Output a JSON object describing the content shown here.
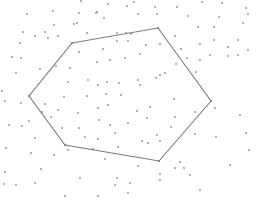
{
  "diagram": {
    "type": "polygon-over-point-cloud",
    "width": 263,
    "height": 215,
    "background": "#ffffff",
    "line_color": "#7a7a7a",
    "point_color": "#8a8a8a",
    "polygon": [
      [
        72,
        43
      ],
      [
        158,
        28
      ],
      [
        211,
        101
      ],
      [
        159,
        161
      ],
      [
        65,
        145
      ],
      [
        29,
        96
      ]
    ],
    "points": [
      [
        81,
        1
      ],
      [
        108,
        4
      ],
      [
        134,
        2
      ],
      [
        27,
        14
      ],
      [
        53,
        11
      ],
      [
        79,
        13
      ],
      [
        97,
        12
      ],
      [
        127,
        6
      ],
      [
        155,
        7
      ],
      [
        177,
        7
      ],
      [
        202,
        2
      ],
      [
        222,
        3
      ],
      [
        246,
        8
      ],
      [
        54,
        25
      ],
      [
        104,
        18
      ],
      [
        77,
        23
      ],
      [
        96,
        13
      ],
      [
        138,
        14
      ],
      [
        188,
        16
      ],
      [
        157,
        14
      ],
      [
        219,
        17
      ],
      [
        248,
        14
      ],
      [
        23,
        32
      ],
      [
        45,
        32
      ],
      [
        35,
        36
      ],
      [
        58,
        36
      ],
      [
        48,
        38
      ],
      [
        74,
        24
      ],
      [
        87,
        33
      ],
      [
        117,
        33
      ],
      [
        126,
        33
      ],
      [
        198,
        27
      ],
      [
        214,
        27
      ],
      [
        243,
        23
      ],
      [
        20,
        43
      ],
      [
        21,
        58
      ],
      [
        12,
        57
      ],
      [
        131,
        34
      ],
      [
        175,
        36
      ],
      [
        214,
        40
      ],
      [
        238,
        40
      ],
      [
        79,
        52
      ],
      [
        103,
        49
      ],
      [
        117,
        41
      ],
      [
        128,
        41
      ],
      [
        146,
        45
      ],
      [
        160,
        44
      ],
      [
        181,
        49
      ],
      [
        200,
        44
      ],
      [
        228,
        47
      ],
      [
        248,
        50
      ],
      [
        70,
        68
      ],
      [
        97,
        62
      ],
      [
        110,
        60
      ],
      [
        125,
        58
      ],
      [
        140,
        54
      ],
      [
        200,
        60
      ],
      [
        228,
        56
      ],
      [
        238,
        55
      ],
      [
        16,
        73
      ],
      [
        40,
        69
      ],
      [
        56,
        66
      ],
      [
        68,
        82
      ],
      [
        88,
        80
      ],
      [
        107,
        82
      ],
      [
        119,
        83
      ],
      [
        138,
        80
      ],
      [
        156,
        78
      ],
      [
        176,
        64
      ],
      [
        187,
        58
      ],
      [
        210,
        55
      ],
      [
        196,
        72
      ],
      [
        2,
        91
      ],
      [
        5,
        101
      ],
      [
        21,
        103
      ],
      [
        45,
        104
      ],
      [
        64,
        97
      ],
      [
        87,
        96
      ],
      [
        98,
        85
      ],
      [
        106,
        94
      ],
      [
        121,
        95
      ],
      [
        140,
        85
      ],
      [
        160,
        75
      ],
      [
        165,
        73
      ],
      [
        42,
        112
      ],
      [
        51,
        117
      ],
      [
        78,
        113
      ],
      [
        98,
        108
      ],
      [
        108,
        105
      ],
      [
        137,
        111
      ],
      [
        150,
        107
      ],
      [
        174,
        99
      ],
      [
        195,
        112
      ],
      [
        215,
        108
      ],
      [
        246,
        133
      ],
      [
        240,
        115
      ],
      [
        9,
        125
      ],
      [
        6,
        148
      ],
      [
        29,
        121
      ],
      [
        58,
        110
      ],
      [
        62,
        128
      ],
      [
        79,
        128
      ],
      [
        110,
        125
      ],
      [
        99,
        120
      ],
      [
        128,
        123
      ],
      [
        147,
        118
      ],
      [
        157,
        135
      ],
      [
        175,
        117
      ],
      [
        195,
        134
      ],
      [
        216,
        137
      ],
      [
        22,
        126
      ],
      [
        35,
        138
      ],
      [
        54,
        155
      ],
      [
        31,
        153
      ],
      [
        85,
        137
      ],
      [
        98,
        139
      ],
      [
        115,
        133
      ],
      [
        142,
        141
      ],
      [
        160,
        141
      ],
      [
        171,
        127
      ],
      [
        5,
        172
      ],
      [
        16,
        185
      ],
      [
        41,
        169
      ],
      [
        68,
        150
      ],
      [
        93,
        149
      ],
      [
        118,
        147
      ],
      [
        148,
        143
      ],
      [
        105,
        159
      ],
      [
        138,
        166
      ],
      [
        184,
        168
      ],
      [
        180,
        162
      ],
      [
        160,
        174
      ],
      [
        190,
        175
      ],
      [
        4,
        184
      ],
      [
        35,
        183
      ],
      [
        80,
        178
      ],
      [
        117,
        178
      ],
      [
        130,
        183
      ],
      [
        160,
        180
      ],
      [
        175,
        168
      ],
      [
        200,
        190
      ],
      [
        230,
        165
      ],
      [
        249,
        150
      ],
      [
        65,
        196
      ],
      [
        98,
        196
      ],
      [
        115,
        185
      ],
      [
        128,
        193
      ]
    ]
  }
}
